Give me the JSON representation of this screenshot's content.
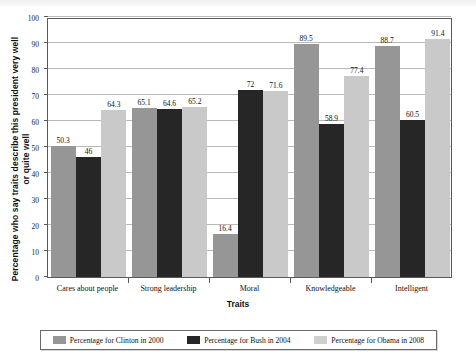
{
  "chart_data": {
    "type": "bar",
    "title": "",
    "xlabel": "Traits",
    "ylabel": "Percentage who say traits describe this president very well or quite well",
    "ylim": [
      0,
      100
    ],
    "ytick_step": 10,
    "yticks": [
      "0",
      "10",
      "20",
      "30",
      "40",
      "50",
      "60",
      "70",
      "80",
      "90",
      "100"
    ],
    "grid": true,
    "legend_position": "bottom",
    "categories": [
      "Cares about people",
      "Strong leadership",
      "Moral",
      "Knowledgeable",
      "Intelligent"
    ],
    "series": [
      {
        "name": "Percentage for Clinton in 2000",
        "color": "#969696",
        "values": [
          50.3,
          65.1,
          16.4,
          89.5,
          88.7
        ],
        "labels": [
          "50.3",
          "65.1",
          "16.4",
          "89.5",
          "88.7"
        ]
      },
      {
        "name": "Percentage for Bush in 2004",
        "color": "#262626",
        "values": [
          46,
          64.6,
          72,
          58.9,
          60.5
        ],
        "labels": [
          "46",
          "64.6",
          "72",
          "58.9",
          "60.5"
        ]
      },
      {
        "name": "Percentage for Obama in 2008",
        "color": "#c9c9c9",
        "values": [
          64.3,
          65.2,
          71.6,
          77.4,
          91.4
        ],
        "labels": [
          "64.3",
          "65.2",
          "71.6",
          "77.4",
          "91.4"
        ]
      }
    ]
  }
}
